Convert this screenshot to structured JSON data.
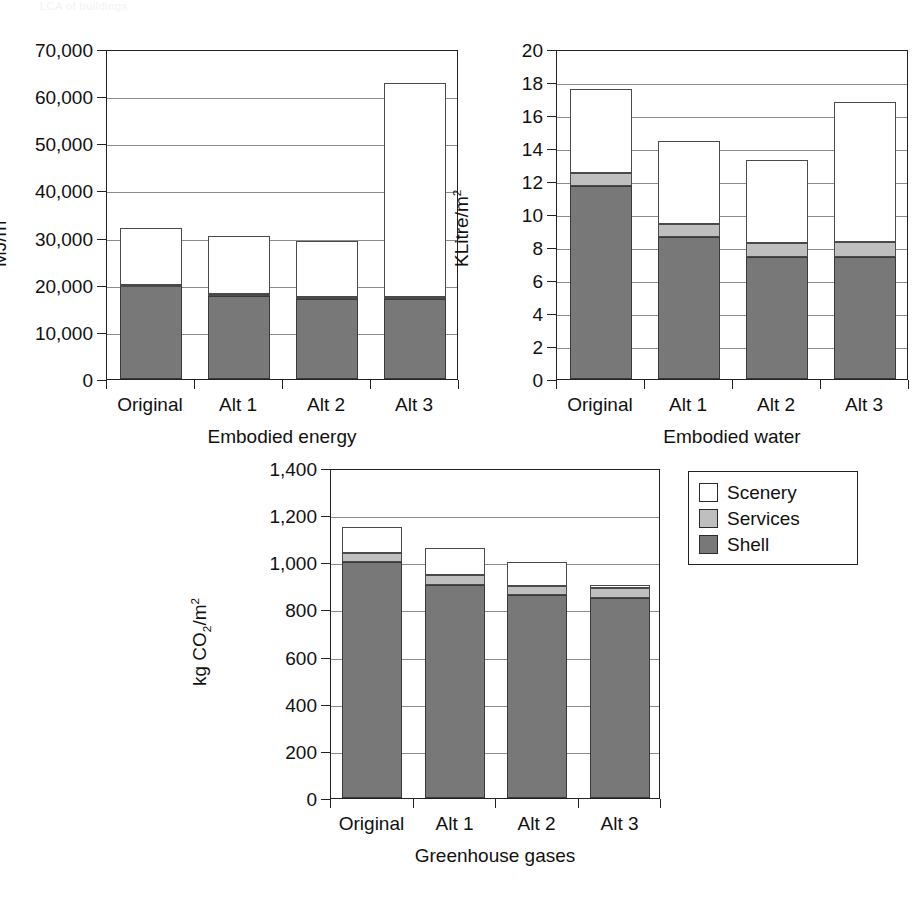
{
  "page": {
    "header_faint_text": "LCA of buildings"
  },
  "legend": {
    "position": "right-of-third-chart",
    "items": [
      {
        "label": "Scenery",
        "color": "#ffffff",
        "swatch": "scenery"
      },
      {
        "label": "Services",
        "color": "#bfbfbf",
        "swatch": "services"
      },
      {
        "label": "Shell",
        "color": "#787878",
        "swatch": "shell"
      }
    ]
  },
  "chart_data": [
    {
      "id": "embodied-energy",
      "type": "bar",
      "stacked": true,
      "title": "",
      "xlabel": "Embodied energy",
      "ylabel": "MJ/m2",
      "ylabel_html": "MJ/m<sup>2</sup>",
      "categories": [
        "Original",
        "Alt 1",
        "Alt 2",
        "Alt 3"
      ],
      "ylim": [
        0,
        70000
      ],
      "ytick_step": 10000,
      "yticks": [
        0,
        10000,
        20000,
        30000,
        40000,
        50000,
        60000,
        70000
      ],
      "ytick_labels": [
        "0",
        "10,000",
        "20,000",
        "30,000",
        "40,000",
        "50,000",
        "60,000",
        "70,000"
      ],
      "grid": true,
      "series": [
        {
          "name": "Shell",
          "values": [
            19700,
            17700,
            16900,
            16900
          ]
        },
        {
          "name": "Services",
          "values": [
            300,
            400,
            400,
            400
          ]
        },
        {
          "name": "Scenery",
          "values": [
            12000,
            12300,
            12000,
            45400
          ]
        }
      ],
      "totals": [
        32000,
        30400,
        29300,
        62700
      ]
    },
    {
      "id": "embodied-water",
      "type": "bar",
      "stacked": true,
      "title": "",
      "xlabel": "Embodied water",
      "ylabel": "KLitre/m2",
      "ylabel_html": "KLitre/m<sup>2</sup>",
      "categories": [
        "Original",
        "Alt 1",
        "Alt 2",
        "Alt 3"
      ],
      "ylim": [
        0,
        20
      ],
      "ytick_step": 2,
      "yticks": [
        0,
        2,
        4,
        6,
        8,
        10,
        12,
        14,
        16,
        18,
        20
      ],
      "ytick_labels": [
        "0",
        "2",
        "4",
        "6",
        "8",
        "10",
        "12",
        "14",
        "16",
        "18",
        "20"
      ],
      "grid": true,
      "series": [
        {
          "name": "Shell",
          "values": [
            11.7,
            8.6,
            7.4,
            7.4
          ]
        },
        {
          "name": "Services",
          "values": [
            0.8,
            0.8,
            0.85,
            0.9
          ]
        },
        {
          "name": "Scenery",
          "values": [
            5.1,
            5.0,
            5.05,
            8.5
          ]
        }
      ],
      "totals": [
        17.6,
        14.4,
        13.3,
        16.8
      ]
    },
    {
      "id": "greenhouse-gases",
      "type": "bar",
      "stacked": true,
      "title": "",
      "xlabel": "Greenhouse gases",
      "ylabel": "kg CO2/m2",
      "ylabel_html": "kg CO<sub>2</sub>/m<sup>2</sup>",
      "categories": [
        "Original",
        "Alt 1",
        "Alt 2",
        "Alt 3"
      ],
      "ylim": [
        0,
        1400
      ],
      "ytick_step": 200,
      "yticks": [
        0,
        200,
        400,
        600,
        800,
        1000,
        1200,
        1400
      ],
      "ytick_labels": [
        "0",
        "200",
        "400",
        "600",
        "800",
        "1,000",
        "1,200",
        "1,400"
      ],
      "grid": true,
      "series": [
        {
          "name": "Shell",
          "values": [
            1000,
            905,
            860,
            850
          ]
        },
        {
          "name": "Services",
          "values": [
            40,
            40,
            40,
            40
          ]
        },
        {
          "name": "Scenery",
          "values": [
            110,
            115,
            100,
            15
          ]
        }
      ],
      "totals": [
        1150,
        1060,
        1000,
        905
      ]
    }
  ]
}
